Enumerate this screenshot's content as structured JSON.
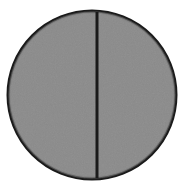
{
  "figure": {
    "title": "Bisected gray disc",
    "background_color": "#ffffff",
    "canvas": {
      "width": 182,
      "height": 185
    },
    "disc": {
      "name": "gray-circle",
      "fill_color": "#8c8c8c",
      "stroke_color": "#1a1a1a",
      "stroke_width": 3,
      "center_x": 92,
      "center_y": 95,
      "radius": 84,
      "texture": "grainy-halftone"
    },
    "divider": {
      "name": "vertical-divider-line",
      "color": "#1a1a1a",
      "stroke_width": 3,
      "x": 97,
      "y_start": 12,
      "y_end": 178,
      "orientation": "vertical"
    }
  }
}
